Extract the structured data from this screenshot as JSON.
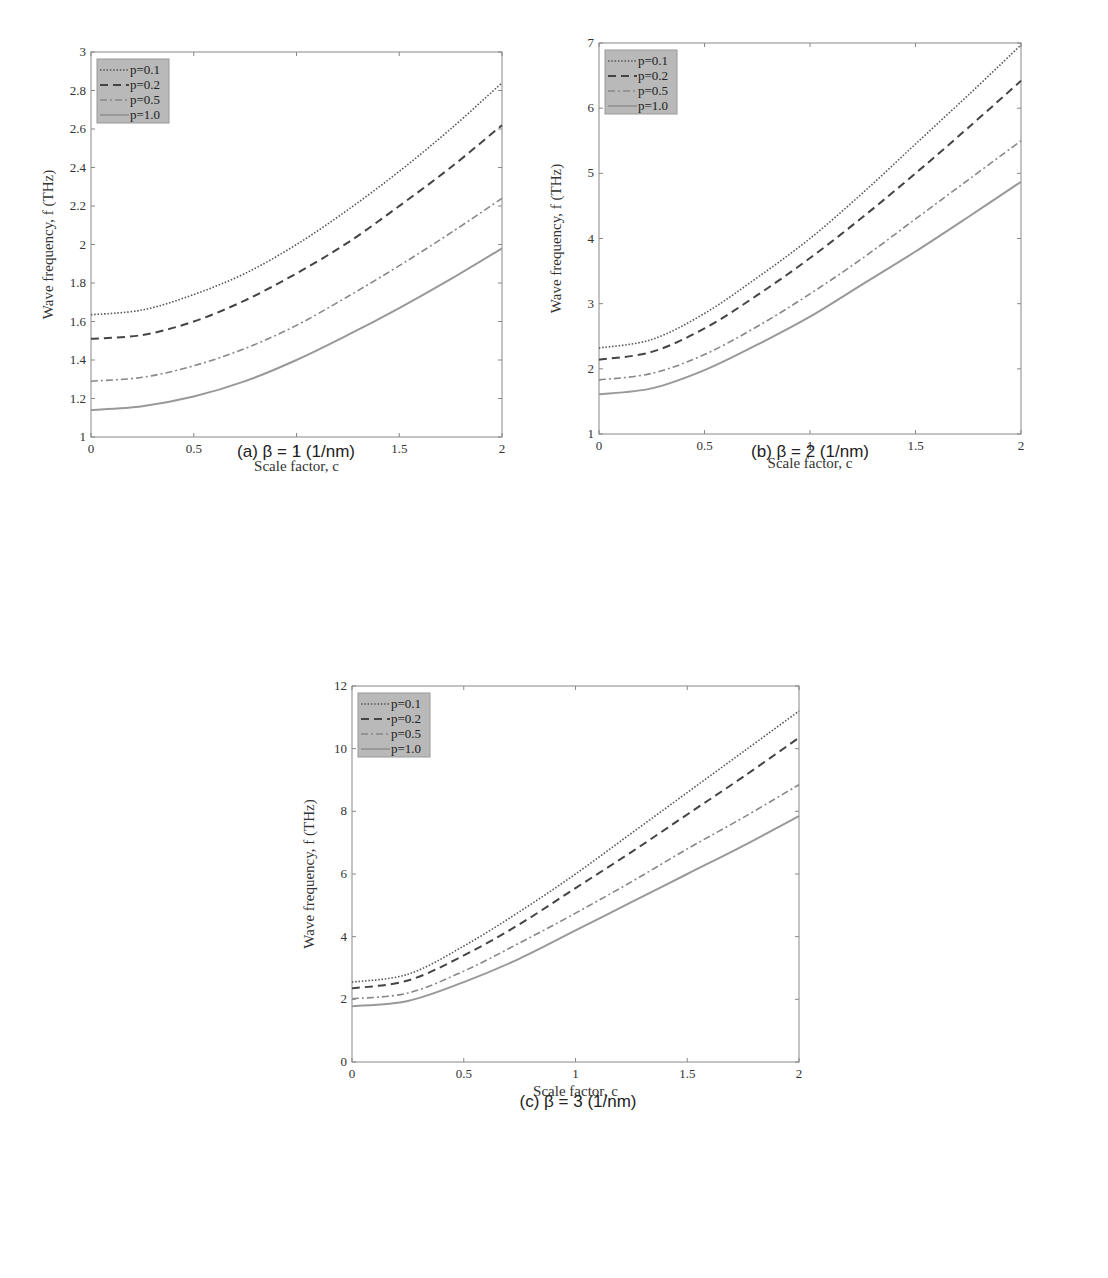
{
  "chart_data": [
    {
      "type": "line",
      "panel": "a",
      "caption": "(a) β = 1 (1/nm)",
      "title": "",
      "xlabel": "Scale factor, c",
      "ylabel": "Wave frequency, f (THz)",
      "xlim": [
        0,
        2
      ],
      "ylim": [
        1,
        3
      ],
      "xticks": [
        "0",
        "0.5",
        "1",
        "1.5",
        "2"
      ],
      "yticks": [
        "1",
        "1.2",
        "1.4",
        "1.6",
        "1.8",
        "2",
        "2.2",
        "2.4",
        "2.6",
        "2.8",
        "3"
      ],
      "grid": false,
      "legend_position": "upper left",
      "x": [
        0,
        0.25,
        0.5,
        0.75,
        1.0,
        1.25,
        1.5,
        1.75,
        2.0
      ],
      "series": [
        {
          "name": "p=0.1",
          "style": "dotted",
          "values": [
            1.635,
            1.66,
            1.74,
            1.85,
            2.0,
            2.18,
            2.38,
            2.6,
            2.84
          ]
        },
        {
          "name": "p=0.2",
          "style": "dashed",
          "values": [
            1.51,
            1.53,
            1.6,
            1.71,
            1.85,
            2.01,
            2.2,
            2.4,
            2.62
          ]
        },
        {
          "name": "p=0.5",
          "style": "dashdot",
          "values": [
            1.29,
            1.31,
            1.37,
            1.46,
            1.58,
            1.73,
            1.89,
            2.06,
            2.24
          ]
        },
        {
          "name": "p=1.0",
          "style": "solid",
          "values": [
            1.14,
            1.16,
            1.21,
            1.29,
            1.4,
            1.53,
            1.67,
            1.82,
            1.98
          ]
        }
      ]
    },
    {
      "type": "line",
      "panel": "b",
      "caption": "(b) β = 2 (1/nm)",
      "title": "",
      "xlabel": "Scale factor, c",
      "ylabel": "Wave frequency, f (THz)",
      "xlim": [
        0,
        2
      ],
      "ylim": [
        1,
        7
      ],
      "xticks": [
        "0",
        "0.5",
        "1",
        "1.5",
        "2"
      ],
      "yticks": [
        "1",
        "2",
        "3",
        "4",
        "5",
        "6",
        "7"
      ],
      "grid": false,
      "legend_position": "upper left",
      "x": [
        0,
        0.25,
        0.5,
        0.75,
        1.0,
        1.25,
        1.5,
        1.75,
        2.0
      ],
      "series": [
        {
          "name": "p=0.1",
          "style": "dotted",
          "values": [
            2.32,
            2.45,
            2.85,
            3.4,
            4.0,
            4.7,
            5.45,
            6.2,
            6.97
          ]
        },
        {
          "name": "p=0.2",
          "style": "dashed",
          "values": [
            2.14,
            2.26,
            2.62,
            3.13,
            3.7,
            4.33,
            5.0,
            5.7,
            6.42
          ]
        },
        {
          "name": "p=0.5",
          "style": "dashdot",
          "values": [
            1.83,
            1.93,
            2.22,
            2.65,
            3.15,
            3.7,
            4.3,
            4.9,
            5.5
          ]
        },
        {
          "name": "p=1.0",
          "style": "solid",
          "values": [
            1.61,
            1.7,
            1.98,
            2.37,
            2.8,
            3.3,
            3.8,
            4.33,
            4.87
          ]
        }
      ]
    },
    {
      "type": "line",
      "panel": "c",
      "caption": "(c) β = 3 (1/nm)",
      "title": "",
      "xlabel": "Scale factor, c",
      "ylabel": "Wave frequency, f (THz)",
      "xlim": [
        0,
        2
      ],
      "ylim": [
        0,
        12
      ],
      "xticks": [
        "0",
        "0.5",
        "1",
        "1.5",
        "2"
      ],
      "yticks": [
        "0",
        "2",
        "4",
        "6",
        "8",
        "10",
        "12"
      ],
      "grid": false,
      "legend_position": "upper left",
      "x": [
        0,
        0.25,
        0.5,
        0.75,
        1.0,
        1.25,
        1.5,
        1.75,
        2.0
      ],
      "series": [
        {
          "name": "p=0.1",
          "style": "dotted",
          "values": [
            2.55,
            2.8,
            3.7,
            4.8,
            6.0,
            7.3,
            8.6,
            9.9,
            11.2
          ]
        },
        {
          "name": "p=0.2",
          "style": "dashed",
          "values": [
            2.35,
            2.6,
            3.4,
            4.4,
            5.55,
            6.7,
            7.9,
            9.1,
            10.35
          ]
        },
        {
          "name": "p=0.5",
          "style": "dashdot",
          "values": [
            2.02,
            2.2,
            2.9,
            3.8,
            4.75,
            5.75,
            6.8,
            7.8,
            8.85
          ]
        },
        {
          "name": "p=1.0",
          "style": "solid",
          "values": [
            1.78,
            1.95,
            2.55,
            3.3,
            4.2,
            5.1,
            6.0,
            6.9,
            7.85
          ]
        }
      ]
    }
  ],
  "captions": {
    "a": "(a) β = 1 (1/nm)",
    "b": "(b) β = 2 (1/nm)",
    "c": "(c) β = 3 (1/nm)"
  },
  "colors": {
    "p01": "#555555",
    "p02": "#444444",
    "p05": "#888888",
    "p10": "#999999",
    "legend_bg": "#b9b9b9",
    "axis": "#888888"
  }
}
